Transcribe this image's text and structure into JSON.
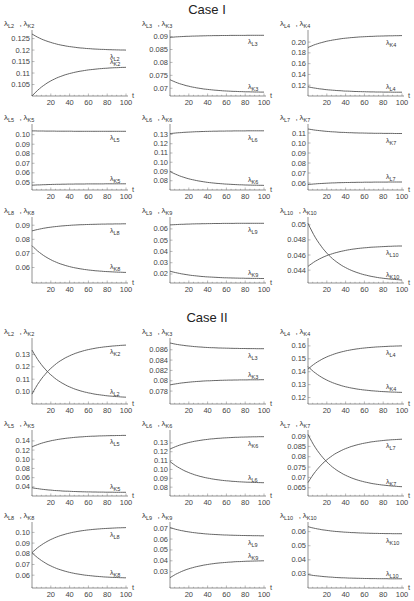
{
  "titles": {
    "case1": "Case I",
    "case2": "Case II"
  },
  "chart_data": [
    {
      "case": "Case I",
      "type": "line",
      "ylabel": "λL2, λK2",
      "xlabel": "t",
      "xticks": [
        20,
        40,
        60,
        80,
        100
      ],
      "yticks": [
        0.105,
        0.11,
        0.115,
        0.12,
        0.125
      ],
      "ylim": [
        0.1,
        0.127
      ],
      "series": [
        {
          "name": "λL2",
          "start": 0.127,
          "end": 0.12
        },
        {
          "name": "λK2",
          "start": 0.1,
          "end": 0.1125
        }
      ],
      "labels_order": [
        "λL2",
        "λK2"
      ]
    },
    {
      "case": "Case I",
      "type": "line",
      "ylabel": "λL3, λK3",
      "xlabel": "t",
      "xticks": [
        20,
        40,
        60,
        80,
        100
      ],
      "yticks": [
        0.07,
        0.075,
        0.08,
        0.085,
        0.09
      ],
      "ylim": [
        0.067,
        0.091
      ],
      "series": [
        {
          "name": "λL3",
          "start": 0.0897,
          "end": 0.0905
        },
        {
          "name": "λK3",
          "start": 0.0733,
          "end": 0.0685
        }
      ],
      "labels_order": [
        "λL3",
        "λK3"
      ]
    },
    {
      "case": "Case I",
      "type": "line",
      "ylabel": "λL4, λK4",
      "xlabel": "t",
      "xticks": [
        20,
        40,
        60,
        80,
        100
      ],
      "yticks": [
        0.12,
        0.14,
        0.16,
        0.18,
        0.2
      ],
      "ylim": [
        0.1,
        0.215
      ],
      "series": [
        {
          "name": "λK4",
          "start": 0.19,
          "end": 0.212
        },
        {
          "name": "λL4",
          "start": 0.117,
          "end": 0.107
        }
      ],
      "labels_order": [
        "λK4",
        "λL4"
      ]
    },
    {
      "case": "Case I",
      "type": "line",
      "ylabel": "λL5, λK5",
      "xlabel": "t",
      "xticks": [
        20,
        40,
        60,
        80,
        100
      ],
      "yticks": [
        0.05,
        0.06,
        0.07,
        0.08,
        0.09,
        0.1
      ],
      "ylim": [
        0.042,
        0.107
      ],
      "series": [
        {
          "name": "λL5",
          "start": 0.104,
          "end": 0.1035
        },
        {
          "name": "λK5",
          "start": 0.047,
          "end": 0.0485
        }
      ],
      "labels_order": [
        "λL5",
        "λK5"
      ]
    },
    {
      "case": "Case I",
      "type": "line",
      "ylabel": "λL6, λK6",
      "xlabel": "t",
      "xticks": [
        20,
        40,
        60,
        80,
        100
      ],
      "yticks": [
        0.08,
        0.09,
        0.1,
        0.11,
        0.12,
        0.13
      ],
      "ylim": [
        0.07,
        0.137
      ],
      "series": [
        {
          "name": "λL6",
          "start": 0.131,
          "end": 0.134
        },
        {
          "name": "λK6",
          "start": 0.09,
          "end": 0.075
        }
      ],
      "labels_order": [
        "λL6",
        "λK6"
      ]
    },
    {
      "case": "Case I",
      "type": "line",
      "ylabel": "λL7, λK7",
      "xlabel": "t",
      "xticks": [
        20,
        40,
        60,
        80,
        100
      ],
      "yticks": [
        0.06,
        0.07,
        0.08,
        0.09,
        0.1,
        0.11
      ],
      "ylim": [
        0.053,
        0.115
      ],
      "series": [
        {
          "name": "λK7",
          "start": 0.114,
          "end": 0.1095
        },
        {
          "name": "λL7",
          "start": 0.0585,
          "end": 0.061
        }
      ],
      "labels_order": [
        "λK7",
        "λL7"
      ]
    },
    {
      "case": "Case I",
      "type": "line",
      "ylabel": "λL8, λK8",
      "xlabel": "t",
      "xticks": [
        20,
        40,
        60,
        80,
        100
      ],
      "yticks": [
        0.06,
        0.07,
        0.08,
        0.09
      ],
      "ylim": [
        0.049,
        0.093
      ],
      "series": [
        {
          "name": "λL8",
          "start": 0.086,
          "end": 0.091
        },
        {
          "name": "λK8",
          "start": 0.0755,
          "end": 0.0565
        }
      ],
      "labels_order": [
        "λL8",
        "λK8"
      ]
    },
    {
      "case": "Case I",
      "type": "line",
      "ylabel": "λL9, λK9",
      "xlabel": "t",
      "xticks": [
        20,
        40,
        60,
        80,
        100
      ],
      "yticks": [
        0.02,
        0.03,
        0.04,
        0.05,
        0.06
      ],
      "ylim": [
        0.012,
        0.067
      ],
      "series": [
        {
          "name": "λL9",
          "start": 0.0635,
          "end": 0.065
        },
        {
          "name": "λK9",
          "start": 0.0225,
          "end": 0.016
        }
      ],
      "labels_order": [
        "λL9",
        "λK9"
      ]
    },
    {
      "case": "Case I",
      "type": "line",
      "ylabel": "λL10, λK10",
      "xlabel": "t",
      "xticks": [
        20,
        40,
        60,
        80,
        100
      ],
      "yticks": [
        0.044,
        0.046,
        0.048,
        0.05
      ],
      "ylim": [
        0.0423,
        0.0505
      ],
      "series": [
        {
          "name": "λL10",
          "start": 0.0445,
          "end": 0.0472
        },
        {
          "name": "λK10",
          "start": 0.0502,
          "end": 0.0427
        }
      ],
      "labels_order": [
        "λL10",
        "λK10"
      ]
    },
    {
      "case": "Case II",
      "type": "line",
      "ylabel": "λL2, λK2",
      "xlabel": "t",
      "xticks": [
        20,
        40,
        60,
        80,
        100
      ],
      "yticks": [
        0.1,
        0.11,
        0.12,
        0.13
      ],
      "ylim": [
        0.09,
        0.14
      ],
      "series": [
        {
          "name": "λK2",
          "start": 0.098,
          "end": 0.1375
        },
        {
          "name": "λL2",
          "start": 0.1335,
          "end": 0.0955
        }
      ],
      "labels_order": [
        "λK2",
        "λL2"
      ]
    },
    {
      "case": "Case II",
      "type": "line",
      "ylabel": "λL3, λK3",
      "xlabel": "t",
      "xticks": [
        20,
        40,
        60,
        80,
        100
      ],
      "yticks": [
        0.078,
        0.08,
        0.082,
        0.084,
        0.086
      ],
      "ylim": [
        0.0755,
        0.0875
      ],
      "series": [
        {
          "name": "λL3",
          "start": 0.0873,
          "end": 0.0862
        },
        {
          "name": "λK3",
          "start": 0.0792,
          "end": 0.0802
        }
      ],
      "labels_order": [
        "λL3",
        "λK3"
      ]
    },
    {
      "case": "Case II",
      "type": "line",
      "ylabel": "λL4, λK4",
      "xlabel": "t",
      "xticks": [
        20,
        40,
        60,
        80,
        100
      ],
      "yticks": [
        0.12,
        0.13,
        0.14,
        0.15,
        0.16
      ],
      "ylim": [
        0.115,
        0.163
      ],
      "series": [
        {
          "name": "λL4",
          "start": 0.142,
          "end": 0.16
        },
        {
          "name": "λK4",
          "start": 0.144,
          "end": 0.124
        }
      ],
      "labels_order": [
        "λL4",
        "λK4"
      ]
    },
    {
      "case": "Case II",
      "type": "line",
      "ylabel": "λL5, λK5",
      "xlabel": "t",
      "xticks": [
        20,
        40,
        60,
        80,
        100
      ],
      "yticks": [
        0.04,
        0.06,
        0.08,
        0.1,
        0.12,
        0.14
      ],
      "ylim": [
        0.02,
        0.155
      ],
      "series": [
        {
          "name": "λL5",
          "start": 0.127,
          "end": 0.152
        },
        {
          "name": "λK5",
          "start": 0.038,
          "end": 0.028
        }
      ],
      "labels_order": [
        "λL5",
        "λK5"
      ]
    },
    {
      "case": "Case II",
      "type": "line",
      "ylabel": "λL6, λK6",
      "xlabel": "t",
      "xticks": [
        20,
        40,
        60,
        80,
        100
      ],
      "yticks": [
        0.08,
        0.09,
        0.1,
        0.11,
        0.12,
        0.13
      ],
      "ylim": [
        0.07,
        0.14
      ],
      "series": [
        {
          "name": "λK6",
          "start": 0.123,
          "end": 0.137
        },
        {
          "name": "λL6",
          "start": 0.109,
          "end": 0.085
        }
      ],
      "labels_order": [
        "λK6",
        "λL6"
      ]
    },
    {
      "case": "Case II",
      "type": "line",
      "ylabel": "λL7, λK7",
      "xlabel": "t",
      "xticks": [
        20,
        40,
        60,
        80,
        100
      ],
      "yticks": [
        0.065,
        0.07,
        0.075,
        0.08,
        0.085,
        0.09
      ],
      "ylim": [
        0.061,
        0.091
      ],
      "series": [
        {
          "name": "λL7",
          "start": 0.0675,
          "end": 0.0885
        },
        {
          "name": "λK7",
          "start": 0.0908,
          "end": 0.0655
        }
      ],
      "labels_order": [
        "λL7",
        "λK7"
      ]
    },
    {
      "case": "Case II",
      "type": "line",
      "ylabel": "λL8, λK8",
      "xlabel": "t",
      "xticks": [
        20,
        40,
        60,
        80,
        100
      ],
      "yticks": [
        0.06,
        0.07,
        0.08,
        0.09,
        0.1
      ],
      "ylim": [
        0.048,
        0.106
      ],
      "series": [
        {
          "name": "λL8",
          "start": 0.081,
          "end": 0.1045
        },
        {
          "name": "λK8",
          "start": 0.081,
          "end": 0.0575
        }
      ],
      "labels_order": [
        "λL8",
        "λK8"
      ]
    },
    {
      "case": "Case II",
      "type": "line",
      "ylabel": "λL9, λK9",
      "xlabel": "t",
      "xticks": [
        20,
        40,
        60,
        80,
        100
      ],
      "yticks": [
        0.03,
        0.04,
        0.05,
        0.06,
        0.07
      ],
      "ylim": [
        0.015,
        0.072
      ],
      "series": [
        {
          "name": "λL9",
          "start": 0.0705,
          "end": 0.063
        },
        {
          "name": "λK9",
          "start": 0.0245,
          "end": 0.04
        }
      ],
      "labels_order": [
        "λL9",
        "λK9"
      ]
    },
    {
      "case": "Case II",
      "type": "line",
      "ylabel": "λL10, λK10",
      "xlabel": "t",
      "xticks": [
        20,
        40,
        60,
        80,
        100
      ],
      "yticks": [
        0.03,
        0.04,
        0.05,
        0.06
      ],
      "ylim": [
        0.02,
        0.064
      ],
      "series": [
        {
          "name": "λK10",
          "start": 0.0635,
          "end": 0.0585
        },
        {
          "name": "λL10",
          "start": 0.0295,
          "end": 0.0265
        }
      ],
      "labels_order": [
        "λK10",
        "λL10"
      ]
    }
  ]
}
